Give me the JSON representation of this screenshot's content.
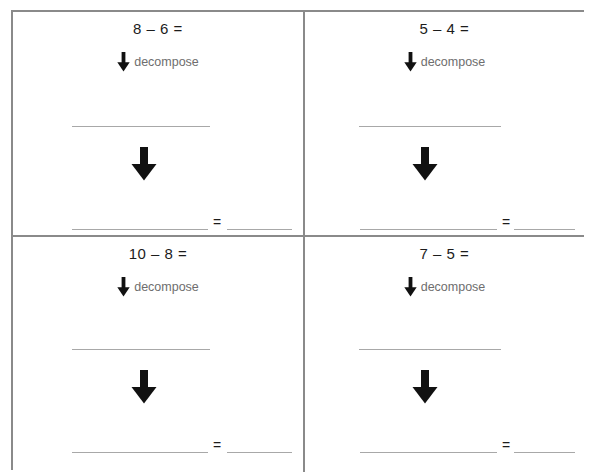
{
  "worksheet": {
    "title": "Subtraction decompose worksheet",
    "step_label": "decompose",
    "equals_sign": "=",
    "line_color": "#a8a8a8",
    "border_color": "#8a8a8a",
    "text_color": "#1c1c1c",
    "label_color": "#6e6e6e",
    "arrow_color": "#111111",
    "cells": [
      {
        "id": "cell-1",
        "position": "top-left",
        "equation": "8 – 6 =",
        "minuend": 8,
        "subtrahend": 6,
        "step_label": "decompose",
        "work_line": "",
        "answer_blank_long": "",
        "equals_sign": "=",
        "answer_blank_short": ""
      },
      {
        "id": "cell-2",
        "position": "top-right",
        "equation": "5 – 4 =",
        "minuend": 5,
        "subtrahend": 4,
        "step_label": "decompose",
        "work_line": "",
        "answer_blank_long": "",
        "equals_sign": "=",
        "answer_blank_short": ""
      },
      {
        "id": "cell-3",
        "position": "bottom-left",
        "equation": "10 – 8 =",
        "minuend": 10,
        "subtrahend": 8,
        "step_label": "decompose",
        "work_line": "",
        "answer_blank_long": "",
        "equals_sign": "=",
        "answer_blank_short": ""
      },
      {
        "id": "cell-4",
        "position": "bottom-right",
        "equation": "7 – 5 =",
        "minuend": 7,
        "subtrahend": 5,
        "step_label": "decompose",
        "work_line": "",
        "answer_blank_long": "",
        "equals_sign": "=",
        "answer_blank_short": ""
      }
    ],
    "icons": {
      "small_arrow": "arrow-down-icon",
      "big_arrow": "arrow-down-icon"
    }
  }
}
